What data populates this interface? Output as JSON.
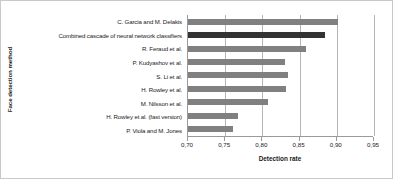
{
  "chart_data": {
    "type": "bar",
    "orientation": "horizontal",
    "title": "",
    "xlabel": "Detection rate",
    "ylabel": "Face detection method",
    "categories": [
      "C. Garcia and M. Delakis",
      "Combined cascade of neural network classifiers",
      "R. Feraud et al.",
      "P. Kudyashov et al.",
      "S. Li et al.",
      "H. Rowley et al.",
      "M. Nilsson et al.",
      "H. Rowley et al. (fast version)",
      "P. Viola and M. Jones"
    ],
    "values": [
      0.902,
      0.884,
      0.858,
      0.83,
      0.835,
      0.832,
      0.808,
      0.767,
      0.76
    ],
    "highlighted_index": 1,
    "xlim": [
      0.7,
      0.95
    ],
    "xticks": [
      0.7,
      0.75,
      0.8,
      0.85,
      0.9,
      0.95
    ],
    "xtick_labels": [
      "0,70",
      "0,75",
      "0,80",
      "0,85",
      "0,90",
      "0,95"
    ],
    "grid": "vertical",
    "legend": "none",
    "bar_color": "#808080",
    "highlight_color": "#333333",
    "gridline_color": "#b5b5b5",
    "axis_color": "#9a9a9a"
  }
}
